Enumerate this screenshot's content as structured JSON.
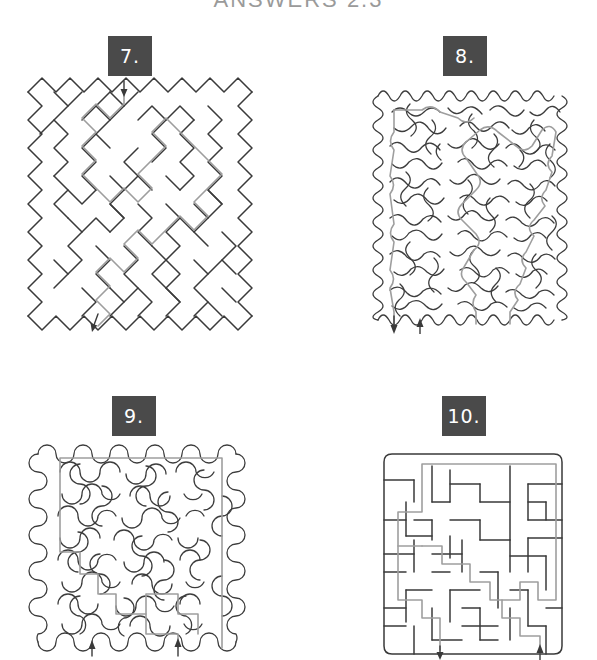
{
  "page": {
    "title": "ANSWERS 2.3",
    "background_color": "#ffffff",
    "wall_color": "#3a3a3a",
    "solution_color": "#9e9e9e",
    "plaque_color": "#4a4a4a",
    "plaque_text_color": "#ffffff",
    "width": 597,
    "height": 660
  },
  "puzzles": [
    {
      "number": "7.",
      "style": "diagonal-zigzag",
      "entrance": {
        "label": "entrance-arrow",
        "direction": "down",
        "position": "top"
      },
      "exit": {
        "label": "exit-arrow",
        "direction": "down",
        "position": "bottom-left"
      },
      "solution_shown": true
    },
    {
      "number": "8.",
      "style": "wavy-curly",
      "entrance": {
        "label": "entrance-arrow",
        "direction": "up",
        "position": "bottom-center"
      },
      "exit": {
        "label": "exit-arrow",
        "direction": "down",
        "position": "bottom-left"
      },
      "solution_shown": true
    },
    {
      "number": "9.",
      "style": "bubble-blob",
      "entrance": {
        "label": "entrance-arrow",
        "direction": "up",
        "position": "bottom-center"
      },
      "exit": {
        "label": "exit-arrow",
        "direction": "up",
        "position": "bottom-left"
      },
      "solution_shown": true
    },
    {
      "number": "10.",
      "style": "rectilinear-grid",
      "entrance": {
        "label": "entrance-arrow",
        "direction": "up",
        "position": "bottom-center"
      },
      "exit": {
        "label": "exit-arrow",
        "direction": "down",
        "position": "bottom-left"
      },
      "solution_shown": true
    }
  ]
}
